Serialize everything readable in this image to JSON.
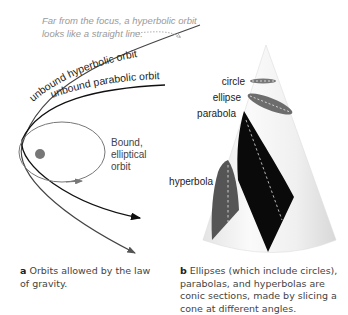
{
  "panel_a": {
    "annotation_line1": "Far from the focus, a hyperbolic orbit",
    "annotation_line2": "looks like a straight line.",
    "label_hyperbolic": "unbound hyperbolic orbit",
    "label_parabolic": "unbound parabolic orbit",
    "label_bound_1": "Bound,",
    "label_bound_2": "elliptical",
    "label_bound_3": "orbit",
    "caption_letter": "a",
    "caption_text": "Orbits allowed by the law of gravity."
  },
  "panel_b": {
    "label_circle": "circle",
    "label_ellipse": "ellipse",
    "label_parabola": "parabola",
    "label_hyperbola": "hyperbola",
    "caption_letter": "b",
    "caption_text": "Ellipses (which include circles), parabolas, and hyperbolas are conic sections, made by slicing a cone at different angles."
  },
  "colors": {
    "hyperbola": "#333333",
    "parabola": "#111111",
    "ellipse": "#777777",
    "focus": "#777777",
    "annotation": "#999999"
  }
}
